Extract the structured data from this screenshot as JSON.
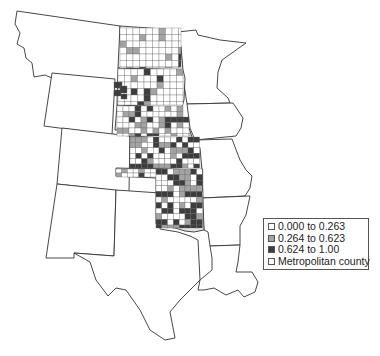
{
  "map": {
    "type": "choropleth",
    "region": "Central United States (Great Plains)",
    "states_outlined": [
      "Montana",
      "Wyoming",
      "Colorado",
      "New Mexico",
      "Texas",
      "Minnesota",
      "Iowa",
      "Missouri",
      "Arkansas",
      "Louisiana"
    ],
    "states_with_counties": [
      "North Dakota",
      "South Dakota",
      "Nebraska",
      "Kansas",
      "Oklahoma"
    ]
  },
  "legend": {
    "items": [
      {
        "label": "0.000 to 0.263",
        "color": "#ffffff"
      },
      {
        "label": "0.264 to 0.623",
        "color": "#a3a3a3"
      },
      {
        "label": "0.624 to 1.00",
        "color": "#3d3d3d"
      },
      {
        "label": "Metropolitan county",
        "color": "#ffffff"
      }
    ]
  },
  "colors": {
    "low": "#ffffff",
    "mid": "#a3a3a3",
    "high": "#3d3d3d",
    "border": "#333333"
  }
}
